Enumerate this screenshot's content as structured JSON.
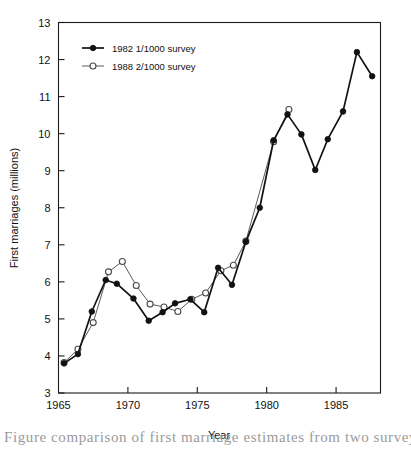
{
  "chart_data": {
    "type": "line",
    "title": "",
    "xlabel": "Year",
    "ylabel": "First marriages (millions)",
    "xlim": [
      1965,
      1988.2
    ],
    "ylim": [
      3,
      13
    ],
    "grid": false,
    "legend_position": "top-left",
    "x_ticks": [
      1965,
      1970,
      1975,
      1980,
      1985
    ],
    "x_tick_labels": [
      "1965",
      "1970",
      "1975",
      "1980",
      "1985"
    ],
    "y_ticks": [
      3,
      4,
      5,
      6,
      7,
      8,
      9,
      10,
      11,
      12,
      13
    ],
    "y_tick_labels": [
      "3",
      "4",
      "5",
      "6",
      "7",
      "8",
      "9",
      "10",
      "11",
      "12",
      "13"
    ],
    "series": [
      {
        "name": "1982 1/1000 survey",
        "marker": "filled-circle",
        "color": "#111111",
        "x": [
          1965.4,
          1966.4,
          1967.4,
          1968.4,
          1969.2,
          1970.4,
          1971.5,
          1972.5,
          1973.4,
          1974.5,
          1975.5,
          1976.5,
          1977.5,
          1978.5,
          1979.5,
          1980.5,
          1981.5,
          1982.5,
          1983.5,
          1984.4,
          1985.5,
          1986.5,
          1987.6
        ],
        "values": [
          3.8,
          4.05,
          5.2,
          6.05,
          5.95,
          5.55,
          4.95,
          5.18,
          5.42,
          5.53,
          5.18,
          6.38,
          5.92,
          7.08,
          8.0,
          9.82,
          10.52,
          9.98,
          9.02,
          9.85,
          10.6,
          12.2,
          11.55
        ]
      },
      {
        "name": "1988 2/1000 survey",
        "marker": "open-circle",
        "color": "#4a4a4a",
        "x": [
          1965.4,
          1966.4,
          1967.5,
          1968.6,
          1969.6,
          1970.6,
          1971.6,
          1972.6,
          1973.6,
          1974.6,
          1975.6,
          1976.7,
          1977.6,
          1978.5,
          1980.5,
          1981.6
        ],
        "values": [
          3.82,
          4.18,
          4.9,
          6.27,
          6.55,
          5.9,
          5.4,
          5.32,
          5.2,
          5.53,
          5.7,
          6.3,
          6.45,
          7.1,
          9.78,
          10.65
        ]
      }
    ]
  },
  "legend": {
    "entries": [
      {
        "label": "1982 1/1000 survey"
      },
      {
        "label": "1988 2/1000 survey"
      }
    ]
  },
  "axes": {
    "x_title": "Year",
    "y_title": "First marriages (millions)"
  },
  "caption": {
    "text": "Figure    comparison of first marriage estimates from two surveys"
  }
}
